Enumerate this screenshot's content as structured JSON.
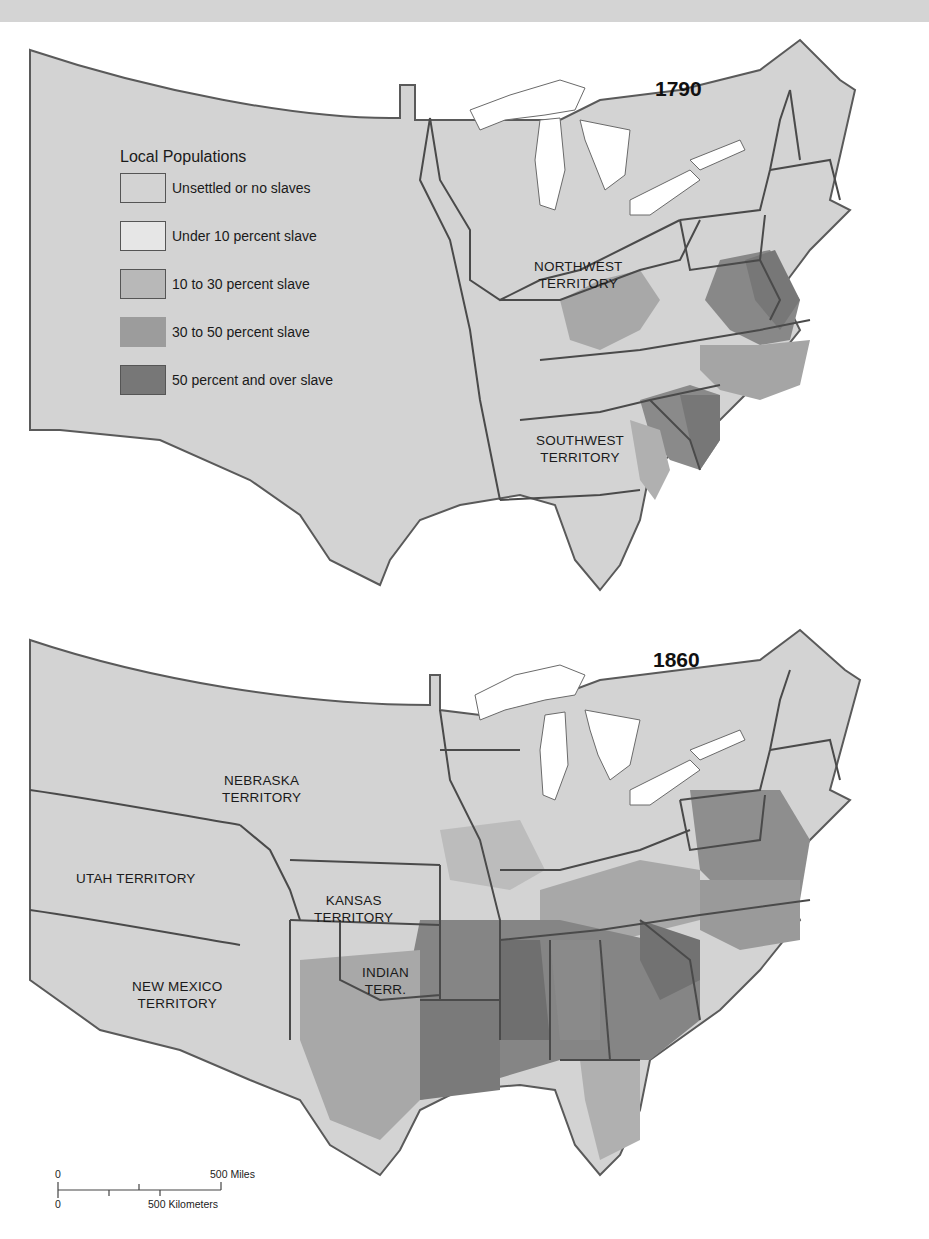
{
  "maps": [
    {
      "year": "1790",
      "territories": [
        {
          "line1": "NORTHWEST",
          "line2": "TERRITORY"
        },
        {
          "line1": "SOUTHWEST",
          "line2": "TERRITORY"
        }
      ]
    },
    {
      "year": "1860",
      "territories": [
        {
          "line1": "NEBRASKA",
          "line2": "TERRITORY"
        },
        {
          "line1": "UTAH TERRITORY",
          "line2": ""
        },
        {
          "line1": "KANSAS",
          "line2": "TERRITORY"
        },
        {
          "line1": "INDIAN",
          "line2": "TERR."
        },
        {
          "line1": "NEW MEXICO",
          "line2": "TERRITORY"
        }
      ]
    }
  ],
  "legend": {
    "title": "Local Populations",
    "items": [
      {
        "label": "Unsettled or no slaves",
        "color": "#d3d3d3"
      },
      {
        "label": "Under 10 percent slave",
        "color": "#e6e6e6"
      },
      {
        "label": "10 to 30 percent slave",
        "color": "#b8b8b8"
      },
      {
        "label": "30 to 50 percent slave",
        "color": "#9c9c9c"
      },
      {
        "label": "50 percent and over slave",
        "color": "#777777"
      }
    ]
  },
  "scale_bar": {
    "miles_start": "0",
    "miles_end": "500 Miles",
    "km_start": "0",
    "km_end": "500 Kilometers"
  },
  "colors": {
    "land": "#d3d3d3",
    "border": "#4a4a4a",
    "water": "#ffffff",
    "band": "#d4d4d4"
  }
}
